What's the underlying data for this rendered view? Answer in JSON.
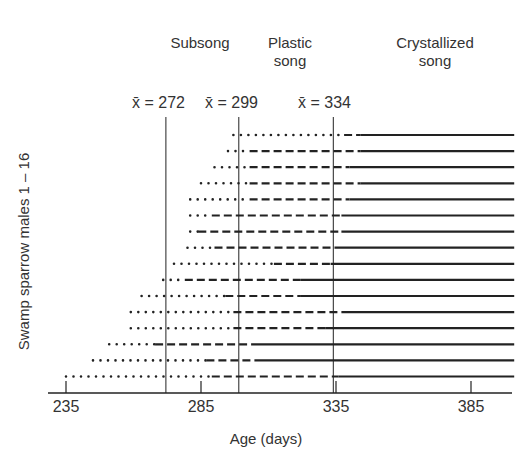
{
  "chart_data": {
    "type": "timeline",
    "title": "",
    "xlabel": "Age (days)",
    "ylabel": "Swamp sparrow males 1 – 16",
    "x_ticks": [
      235,
      285,
      335,
      385
    ],
    "xlim": [
      235,
      401
    ],
    "stage_labels": [
      {
        "text": "Subsong",
        "lines": [
          "Subsong"
        ]
      },
      {
        "text": "Plastic song",
        "lines": [
          "Plastic",
          "song"
        ]
      },
      {
        "text": "Crystallized song",
        "lines": [
          "Crystallized",
          "song"
        ]
      }
    ],
    "mean_lines": [
      {
        "label": "x̄ = 272",
        "value": 272
      },
      {
        "label": "x̄ = 299",
        "value": 299
      },
      {
        "label": "x̄ = 334",
        "value": 334
      }
    ],
    "legend_encoding": {
      "dotted": "Subsong",
      "dashed": "Plastic song",
      "solid": "Crystallized song"
    },
    "series": [
      {
        "name": "Male 1",
        "subsong_start": 297,
        "plastic_start": 338,
        "crystallized_start": 344,
        "end": 401
      },
      {
        "name": "Male 2",
        "subsong_start": 295,
        "plastic_start": 303,
        "crystallized_start": 344,
        "end": 401
      },
      {
        "name": "Male 3",
        "subsong_start": 290,
        "plastic_start": 303,
        "crystallized_start": 340,
        "end": 401
      },
      {
        "name": "Male 4",
        "subsong_start": 285,
        "plastic_start": 303,
        "crystallized_start": 344,
        "end": 401
      },
      {
        "name": "Male 5",
        "subsong_start": 281,
        "plastic_start": 303,
        "crystallized_start": 340,
        "end": 401
      },
      {
        "name": "Male 6",
        "subsong_start": 281,
        "plastic_start": 289,
        "crystallized_start": 337,
        "end": 401
      },
      {
        "name": "Male 7",
        "subsong_start": 281,
        "plastic_start": 284,
        "crystallized_start": 337,
        "end": 401
      },
      {
        "name": "Male 8",
        "subsong_start": 280,
        "plastic_start": 290,
        "crystallized_start": 335,
        "end": 401
      },
      {
        "name": "Male 9",
        "subsong_start": 275,
        "plastic_start": 312,
        "crystallized_start": 333,
        "end": 401
      },
      {
        "name": "Male 10",
        "subsong_start": 271,
        "plastic_start": 279,
        "crystallized_start": 322,
        "end": 401
      },
      {
        "name": "Male 11",
        "subsong_start": 263,
        "plastic_start": 294,
        "crystallized_start": 322,
        "end": 401
      },
      {
        "name": "Male 12",
        "subsong_start": 259,
        "plastic_start": 297,
        "crystallized_start": 337,
        "end": 401
      },
      {
        "name": "Male 13",
        "subsong_start": 259,
        "plastic_start": 297,
        "crystallized_start": 331,
        "end": 401
      },
      {
        "name": "Male 14",
        "subsong_start": 251,
        "plastic_start": 268,
        "crystallized_start": 305,
        "end": 401
      },
      {
        "name": "Male 15",
        "subsong_start": 245,
        "plastic_start": 287,
        "crystallized_start": 305,
        "end": 401
      },
      {
        "name": "Male 16",
        "subsong_start": 235,
        "plastic_start": 289,
        "crystallized_start": 336,
        "end": 401
      }
    ],
    "grid": false,
    "legend_position": "none"
  },
  "layout": {
    "x0_px": 66,
    "x0_val": 235,
    "px_per_day": 2.7,
    "row_top_px": 135,
    "row_step_px": 16.1,
    "axis_y_px": 393,
    "color": "#222222"
  }
}
